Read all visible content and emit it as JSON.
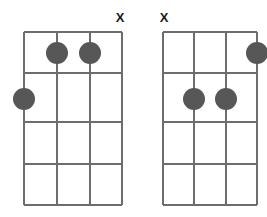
{
  "page": {
    "background_color": "#ffffff",
    "width": 267,
    "height": 217
  },
  "style": {
    "line_color": "#6d6d6d",
    "nut_color": "#6d6d6d",
    "dot_color": "#575757",
    "mute_color": "#1a1a1a",
    "dot_radius": 11
  },
  "diagrams": [
    {
      "id": "chord-diagram-left",
      "string_count": 4,
      "fret_count": 4,
      "geometry": {
        "left": 24,
        "right": 122,
        "top": 32,
        "bottom": 205,
        "string_x": [
          24,
          57,
          90,
          122
        ],
        "fret_y": [
          32,
          73,
          122,
          164,
          205
        ]
      },
      "markers": [
        {
          "name": "mute-marker-string-4",
          "label": "X",
          "string": 4,
          "x": 120,
          "y": 22
        }
      ],
      "dots": [
        {
          "name": "finger-dot-string-2-fret-1",
          "string": 2,
          "fret": 1,
          "cx": 57,
          "cy": 53
        },
        {
          "name": "finger-dot-string-3-fret-1",
          "string": 3,
          "fret": 1,
          "cx": 90,
          "cy": 53
        },
        {
          "name": "finger-dot-string-1-fret-2",
          "string": 1,
          "fret": 2,
          "cx": 24,
          "cy": 99
        }
      ]
    },
    {
      "id": "chord-diagram-right",
      "string_count": 4,
      "fret_count": 4,
      "geometry": {
        "left": 163,
        "right": 257,
        "top": 32,
        "bottom": 205,
        "string_x": [
          163,
          194,
          226,
          257
        ],
        "fret_y": [
          32,
          73,
          122,
          164,
          205
        ]
      },
      "markers": [
        {
          "name": "mute-marker-string-1",
          "label": "X",
          "string": 1,
          "x": 164,
          "y": 22
        }
      ],
      "dots": [
        {
          "name": "finger-dot-string-4-fret-1",
          "string": 4,
          "fret": 1,
          "cx": 257,
          "cy": 53
        },
        {
          "name": "finger-dot-string-2-fret-2",
          "string": 2,
          "fret": 2,
          "cx": 194,
          "cy": 99
        },
        {
          "name": "finger-dot-string-3-fret-2",
          "string": 3,
          "fret": 2,
          "cx": 226,
          "cy": 99
        }
      ]
    }
  ]
}
